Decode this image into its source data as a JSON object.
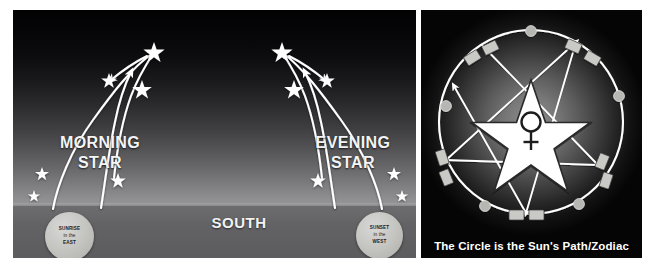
{
  "left_panel": {
    "morning_label": "MORNING\nSTAR",
    "morning_label_line1": "MORNING",
    "morning_label_line2": "STAR",
    "evening_label_line1": "EVENING",
    "evening_label_line2": "STAR",
    "direction_label": "SOUTH",
    "sunrise_marker": {
      "line1": "SUNRISE",
      "line2": "in the",
      "line3": "EAST"
    },
    "sunset_marker": {
      "line1": "SUNSET",
      "line2": "in the",
      "line3": "WEST"
    },
    "star_count_morning": 6,
    "star_count_evening": 6,
    "colors": {
      "sky_top": "#020203",
      "sky_horizon": "#98989a",
      "ground": "#636366",
      "path_stroke": "#ffffff",
      "label_text": "#f4f4f4",
      "marker_fill": "#c2c2bf"
    }
  },
  "right_panel": {
    "caption": "The Circle is the Sun's Path/Zodiac",
    "center_symbol": "♀",
    "center_shape": "five-pointed-star",
    "ring_node_count": 10,
    "ring_marker_count": 5,
    "colors": {
      "glow_center": "#8f8f8f",
      "glow_edge": "#050505",
      "circle_stroke": "#ffffff",
      "pentagram_stroke": "#ffffff",
      "node_fill": "#c9c9c6",
      "caption_text": "#ffffff"
    }
  }
}
